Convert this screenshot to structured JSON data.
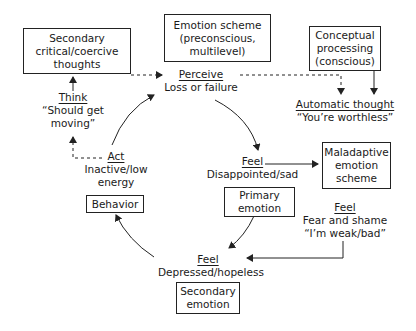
{
  "boxes": {
    "secondary_thoughts": [
      "Secondary",
      "critical/coercive",
      "thoughts"
    ],
    "emotion_scheme": [
      "Emotion scheme",
      "(preconscious,",
      "multilevel)"
    ],
    "conceptual": [
      "Conceptual",
      "processing",
      "(conscious)"
    ],
    "maladaptive": [
      "Maladaptive",
      "emotion",
      "scheme"
    ],
    "primary_emotion": [
      "Primary",
      "emotion"
    ],
    "behavior": [
      "Behavior"
    ],
    "secondary_emotion": [
      "Secondary",
      "emotion"
    ]
  },
  "nodes": {
    "perceive": {
      "head": "Perceive",
      "lines": [
        "Loss or failure"
      ]
    },
    "automatic": {
      "head": "Automatic thought",
      "lines": [
        "“You’re worthless”"
      ]
    },
    "feel_primary": {
      "head": "Feel",
      "lines": [
        "Disappointed/sad"
      ]
    },
    "feel_fear": {
      "head": "Feel",
      "lines": [
        "Fear and shame",
        "“I’m weak/bad”"
      ]
    },
    "feel_depressed": {
      "head": "Feel",
      "lines": [
        "Depressed/hopeless"
      ]
    },
    "act": {
      "head": "Act",
      "lines": [
        "Inactive/low",
        "energy"
      ]
    },
    "think": {
      "head": "Think",
      "lines": [
        "“Should get",
        "moving”"
      ]
    }
  }
}
